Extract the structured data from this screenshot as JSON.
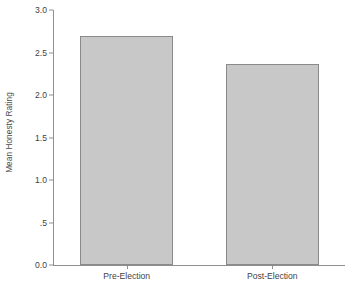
{
  "chart_data": {
    "type": "bar",
    "title": "",
    "xlabel": "",
    "ylabel": "Mean Honesty Rating",
    "categories": [
      "Pre-Election",
      "Post-Election"
    ],
    "values": [
      2.7,
      2.37
    ],
    "ylim": [
      0.0,
      3.0
    ],
    "yticks": [
      0.0,
      0.5,
      1.0,
      1.5,
      2.0,
      2.5,
      3.0
    ],
    "ytick_labels": [
      "0.0",
      ".5",
      "1.0",
      "1.5",
      "2.0",
      "2.5",
      "3.0"
    ],
    "grid": false,
    "legend": false,
    "legend_position": "none",
    "bar_fill_color": "#c8c8c8",
    "bar_edge_color": "#8a8a8a",
    "axis_color": "#8f8f8f",
    "text_color": "#3f3f3f",
    "background_color": "#ffffff"
  }
}
